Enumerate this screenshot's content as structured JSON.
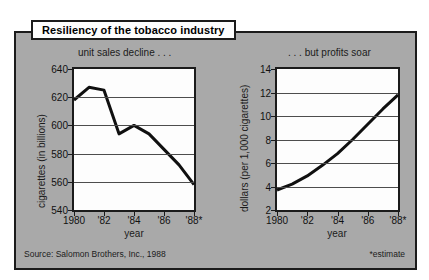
{
  "figure": {
    "title": "Resiliency of the tobacco industry",
    "source_note": "Source: Salomon Brothers, Inc., 1988",
    "estimate_note": "*estimate",
    "panel_color": "#a9a9a9",
    "plot_background": "#fdfdfd",
    "line_color": "#101010",
    "border_color": "#1b1b1b"
  },
  "chart_data": [
    {
      "type": "line",
      "title": "unit sales decline . . .",
      "xlabel": "year",
      "ylabel": "cigarettes (in billions)",
      "categories": [
        "1980",
        "'81",
        "'82",
        "'83",
        "'84",
        "'85",
        "'86",
        "'87",
        "'88*"
      ],
      "x": [
        1980,
        1981,
        1982,
        1983,
        1984,
        1985,
        1986,
        1987,
        1988
      ],
      "values": [
        618,
        627,
        625,
        594,
        600,
        594,
        583,
        572,
        558
      ],
      "xtick_labels": [
        "1980",
        "'82",
        "'84",
        "'86",
        "'88*"
      ],
      "xtick_values": [
        1980,
        1982,
        1984,
        1986,
        1988
      ],
      "ytick_labels": [
        "540",
        "560",
        "580",
        "600",
        "620",
        "640"
      ],
      "ytick_values": [
        540,
        560,
        580,
        600,
        620,
        640
      ],
      "ylim": [
        540,
        640
      ],
      "xlim": [
        1980,
        1988
      ],
      "grid": true,
      "legend": "none"
    },
    {
      "type": "line",
      "title": ". . . but profits soar",
      "xlabel": "year",
      "ylabel": "dollars (per 1,000 cigarettes)",
      "categories": [
        "1980",
        "'81",
        "'82",
        "'83",
        "'84",
        "'85",
        "'86",
        "'87",
        "'88*"
      ],
      "x": [
        1980,
        1981,
        1982,
        1983,
        1984,
        1985,
        1986,
        1987,
        1988
      ],
      "values": [
        3.7,
        4.2,
        4.9,
        5.8,
        6.8,
        8.0,
        9.3,
        10.6,
        11.8
      ],
      "xtick_labels": [
        "1980",
        "'82",
        "'84",
        "'86",
        "'88*"
      ],
      "xtick_values": [
        1980,
        1982,
        1984,
        1986,
        1988
      ],
      "ytick_labels": [
        "2",
        "4",
        "6",
        "8",
        "10",
        "12",
        "14"
      ],
      "ytick_values": [
        2,
        4,
        6,
        8,
        10,
        12,
        14
      ],
      "ylim": [
        2,
        14
      ],
      "xlim": [
        1980,
        1988
      ],
      "grid": true,
      "legend": "none"
    }
  ]
}
